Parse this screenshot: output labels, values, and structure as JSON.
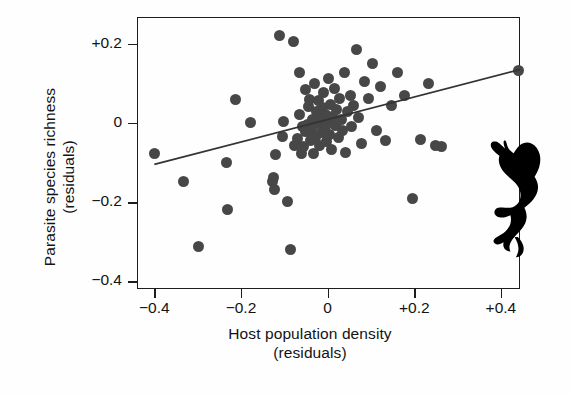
{
  "chart_data": {
    "type": "scatter",
    "title": "",
    "xlabel": "Host population density (residuals)",
    "ylabel": "Parasite species richness (residuals)",
    "xlabel_line1": "Host population density",
    "xlabel_line2": "(residuals)",
    "ylabel_line1": "Parasite species richness",
    "ylabel_line2": "(residuals)",
    "xlim": [
      -0.44,
      0.444
    ],
    "ylim": [
      -0.42,
      0.268
    ],
    "xticks": [
      -0.4,
      -0.2,
      0,
      0.2,
      0.4
    ],
    "xticklabels": [
      "−0.4",
      "−0.2",
      "0",
      "+0.2",
      "+0.4"
    ],
    "yticks": [
      0.2,
      0,
      -0.2,
      -0.4
    ],
    "yticklabels": [
      "+0.2",
      "0",
      "−0.2",
      "−0.4"
    ],
    "grid": false,
    "legend": null,
    "marker_color": "#474747",
    "marker_size": 11,
    "line_color": "#333333",
    "frame_color": "#1d1d1d",
    "trendline": {
      "label": "regression line",
      "x": [
        -0.4,
        0.444
      ],
      "y": [
        -0.105,
        0.135
      ],
      "slope": 0.285,
      "intercept": 0.009
    },
    "points": [
      [
        -0.4,
        -0.078
      ],
      [
        -0.333,
        -0.147
      ],
      [
        -0.297,
        -0.312
      ],
      [
        -0.234,
        -0.099
      ],
      [
        -0.23,
        -0.218
      ],
      [
        -0.212,
        0.06
      ],
      [
        -0.177,
        0.002
      ],
      [
        -0.128,
        -0.148
      ],
      [
        -0.124,
        -0.138
      ],
      [
        -0.123,
        -0.168
      ],
      [
        -0.12,
        -0.08
      ],
      [
        -0.112,
        0.222
      ],
      [
        -0.104,
        -0.035
      ],
      [
        -0.101,
        0.003
      ],
      [
        -0.092,
        -0.199
      ],
      [
        -0.086,
        -0.32
      ],
      [
        -0.078,
        0.205
      ],
      [
        -0.076,
        -0.057
      ],
      [
        -0.07,
        -0.04
      ],
      [
        -0.066,
        0.022
      ],
      [
        -0.064,
        0.128
      ],
      [
        -0.061,
        -0.076
      ],
      [
        -0.058,
        -0.008
      ],
      [
        -0.056,
        -0.06
      ],
      [
        -0.052,
        0.084
      ],
      [
        -0.05,
        -0.022
      ],
      [
        -0.046,
        -0.003
      ],
      [
        -0.044,
        0.041
      ],
      [
        -0.042,
        0.06
      ],
      [
        -0.04,
        -0.044
      ],
      [
        -0.037,
        -0.018
      ],
      [
        -0.034,
        0.008
      ],
      [
        -0.032,
        -0.078
      ],
      [
        -0.03,
        0.1
      ],
      [
        -0.028,
        -0.036
      ],
      [
        -0.025,
        0.03
      ],
      [
        -0.023,
        -0.002
      ],
      [
        -0.021,
        0.058
      ],
      [
        -0.018,
        -0.057
      ],
      [
        -0.016,
        0.014
      ],
      [
        -0.014,
        -0.024
      ],
      [
        -0.011,
        0.04
      ],
      [
        -0.009,
        0.077
      ],
      [
        -0.006,
        -0.01
      ],
      [
        -0.004,
        0.022
      ],
      [
        -0.002,
        -0.048
      ],
      [
        0.0,
        0.004
      ],
      [
        0.002,
        0.112
      ],
      [
        0.005,
        -0.028
      ],
      [
        0.007,
        0.046
      ],
      [
        0.01,
        -0.066
      ],
      [
        0.012,
        0.016
      ],
      [
        0.015,
        0.088
      ],
      [
        0.018,
        -0.006
      ],
      [
        0.021,
        0.035
      ],
      [
        0.024,
        -0.038
      ],
      [
        0.028,
        0.062
      ],
      [
        0.031,
        0.008
      ],
      [
        0.035,
        -0.018
      ],
      [
        0.039,
        0.128
      ],
      [
        0.042,
        -0.074
      ],
      [
        0.047,
        0.03
      ],
      [
        0.052,
        0.07
      ],
      [
        0.056,
        -0.01
      ],
      [
        0.06,
        0.044
      ],
      [
        0.066,
        0.186
      ],
      [
        0.072,
        0.015
      ],
      [
        0.078,
        -0.052
      ],
      [
        0.086,
        0.105
      ],
      [
        0.094,
        0.062
      ],
      [
        0.103,
        0.15
      ],
      [
        0.112,
        -0.02
      ],
      [
        0.122,
        0.092
      ],
      [
        0.133,
        -0.045
      ],
      [
        0.148,
        0.045
      ],
      [
        0.162,
        0.128
      ],
      [
        0.178,
        0.07
      ],
      [
        0.196,
        -0.19
      ],
      [
        0.214,
        -0.042
      ],
      [
        0.232,
        0.1
      ],
      [
        0.248,
        -0.058
      ],
      [
        0.262,
        -0.06
      ],
      [
        0.44,
        0.132
      ]
    ]
  },
  "silhouette": {
    "name": "monkey-silhouette",
    "description": "climbing primate facing left with raised arm",
    "color": "#000000"
  }
}
